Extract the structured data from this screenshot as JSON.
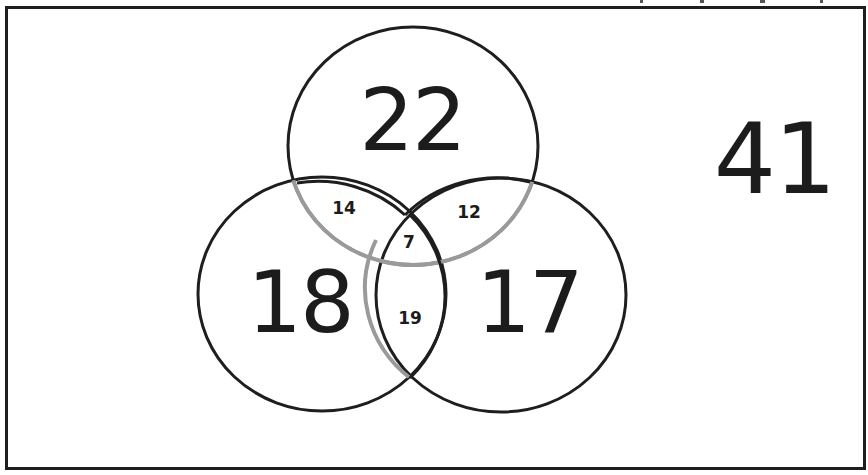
{
  "diagram": {
    "type": "venn-3-set",
    "colors": {
      "outline": "#1e1e1e",
      "inner_arc": "#9a9a9a",
      "text": "#1c1c1c",
      "background": "#ffffff"
    },
    "regions": {
      "top_only": "22",
      "left_only": "18",
      "right_only": "17",
      "top_left": "14",
      "top_right": "12",
      "left_right": "19",
      "all_three": "7",
      "outside": "41"
    }
  }
}
